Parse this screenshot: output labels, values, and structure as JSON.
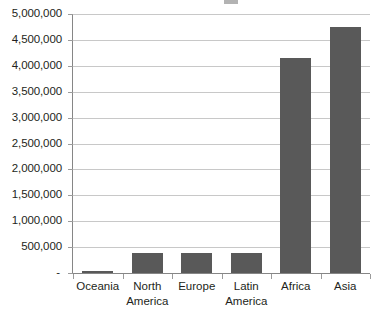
{
  "chart_data": {
    "type": "bar",
    "title": "",
    "subtitle": "",
    "xlabel": "",
    "ylabel": "",
    "categories": [
      "Oceania",
      "North America",
      "Europe",
      "Latin America",
      "Africa",
      "Asia"
    ],
    "values": [
      40000,
      385000,
      390000,
      390000,
      4150000,
      4750000
    ],
    "series": [
      {
        "name": "",
        "values": [
          40000,
          385000,
          390000,
          390000,
          4150000,
          4750000
        ]
      }
    ],
    "ylim": [
      0,
      5000000
    ],
    "ytick_values": [
      0,
      500000,
      1000000,
      1500000,
      2000000,
      2500000,
      3000000,
      3500000,
      4000000,
      4500000,
      5000000
    ],
    "ytick_labels": [
      "-",
      "500,000",
      "1,000,000",
      "1,500,000",
      "2,000,000",
      "2,500,000",
      "3,000,000",
      "3,500,000",
      "4,000,000",
      "4,500,000",
      "5,000,000"
    ],
    "grid": true,
    "grid_axis": "y",
    "legend": false,
    "legend_position": "none",
    "bar_color": "#595959",
    "gridline_color": "#c8c8c8",
    "axis_color": "#868686",
    "text_color": "#231f20",
    "plot_background": "#ffffff",
    "annotations": []
  },
  "category_label_lines": [
    [
      "Oceania"
    ],
    [
      "North",
      "America"
    ],
    [
      "Europe"
    ],
    [
      "Latin",
      "America"
    ],
    [
      "Africa"
    ],
    [
      "Asia"
    ]
  ]
}
